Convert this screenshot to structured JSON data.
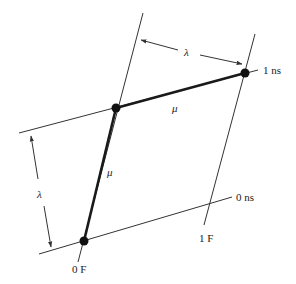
{
  "diagram": {
    "type": "spacetime-lattice",
    "labels": {
      "time_top": "1 ns",
      "time_bottom": "0 ns",
      "space_left": "0 F",
      "space_right": "1 F",
      "lambda_top": "λ",
      "lambda_left": "λ",
      "mu_top": "μ",
      "mu_left": "μ"
    },
    "vertices": [
      {
        "name": "origin",
        "label": "0 F / 0 ns"
      },
      {
        "name": "upper-left",
        "label": ""
      },
      {
        "name": "upper-right",
        "label": "1 ns"
      }
    ],
    "colors": {
      "line": "#333333",
      "thick_line": "#1a1a1a",
      "vertex": "#111111",
      "background": "#ffffff"
    }
  }
}
